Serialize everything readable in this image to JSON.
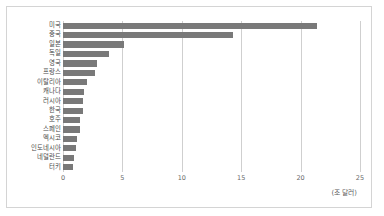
{
  "chart_data": {
    "type": "bar",
    "orientation": "horizontal",
    "title": "",
    "subtitle": "",
    "xlabel": "(조 달러)",
    "ylabel": "",
    "unit_label": "(조 달러)",
    "categories": [
      "미국",
      "중국",
      "일본",
      "독일",
      "영국",
      "프랑스",
      "이탈리아",
      "캐나다",
      "러시아",
      "한국",
      "호주",
      "스페인",
      "멕시코",
      "인도네시아",
      "네덜란드",
      "터키"
    ],
    "values": [
      21.4,
      14.3,
      5.1,
      3.9,
      2.9,
      2.7,
      2.0,
      1.8,
      1.7,
      1.7,
      1.4,
      1.4,
      1.2,
      1.1,
      0.9,
      0.8
    ],
    "xlim": [
      0,
      26.5
    ],
    "xticks": [
      0,
      5,
      10,
      15,
      20,
      25
    ],
    "xtick_labels": [
      "0",
      "5",
      "10",
      "15",
      "20",
      "25"
    ],
    "grid": "vertical",
    "legend": "none",
    "bar_color": "#797979",
    "gridline_color": "#cfcfcf",
    "border_color": "#d4d4d4",
    "background_color": "#ffffff",
    "series": [
      {
        "name": "GDP",
        "values": [
          21.4,
          14.3,
          5.1,
          3.9,
          2.9,
          2.7,
          2.0,
          1.8,
          1.7,
          1.7,
          1.4,
          1.4,
          1.2,
          1.1,
          0.9,
          0.8
        ]
      }
    ]
  }
}
